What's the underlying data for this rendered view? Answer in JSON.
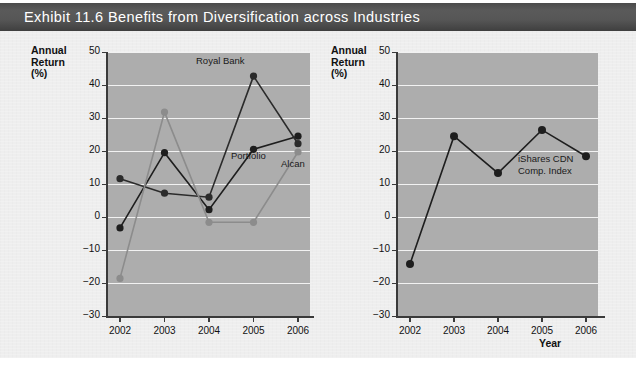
{
  "header": {
    "title": "Exhibit 11.6  Benefits from Diversification across Industries"
  },
  "colors": {
    "header_bar": "#4f4f4f",
    "panel": "#eeeeee",
    "plot_background": "#adadad",
    "gridline": "#f2f2f2",
    "axis": "#3a3a3a",
    "series_dark": "#1e1e1e",
    "series_mid": "#4a4a4a",
    "series_gray": "#8c8c8c"
  },
  "left_chart": {
    "y_axis_title_line1": "Annual",
    "y_axis_title_line2": "Return",
    "y_axis_title_line3": "(%)",
    "labels": {
      "royal_bank": "Royal Bank",
      "portfolio": "Portfolio",
      "alcan": "Alcan"
    }
  },
  "right_chart": {
    "y_axis_title_line1": "Annual",
    "y_axis_title_line2": "Return",
    "y_axis_title_line3": "(%)",
    "x_axis_title": "Year",
    "labels": {
      "ishares_line1": "iShares CDN",
      "ishares_line2": "Comp. Index"
    }
  },
  "chart_data": [
    {
      "id": "left",
      "type": "line",
      "title": "",
      "xlabel": "",
      "ylabel": "Annual Return (%)",
      "x": [
        "2002",
        "2003",
        "2004",
        "2005",
        "2006"
      ],
      "categories": [
        "2002",
        "2003",
        "2004",
        "2005",
        "2006"
      ],
      "ylim": [
        -30,
        50
      ],
      "yticks": [
        -30,
        -20,
        -10,
        0,
        10,
        20,
        30,
        40,
        50
      ],
      "ytick_labels": [
        "−30",
        "−20",
        "−10",
        "0",
        "10",
        "20",
        "30",
        "40",
        "50"
      ],
      "grid": true,
      "legend": "inline-annotations",
      "series": [
        {
          "name": "Royal Bank",
          "color": "#1e1e1e",
          "marker": "circle",
          "values": [
            -3.3,
            19.5,
            2.2,
            20.5,
            24.5
          ]
        },
        {
          "name": "Portfolio",
          "color": "#2b2b2b",
          "marker": "circle",
          "values": [
            11.6,
            7.2,
            6.0,
            42.7,
            22.2
          ]
        },
        {
          "name": "Alcan",
          "color": "#8c8c8c",
          "marker": "circle",
          "values": [
            -18.6,
            31.8,
            -1.6,
            -1.6,
            19.7
          ]
        }
      ]
    },
    {
      "id": "right",
      "type": "line",
      "title": "",
      "xlabel": "Year",
      "ylabel": "Annual Return (%)",
      "x": [
        "2002",
        "2003",
        "2004",
        "2005",
        "2006"
      ],
      "categories": [
        "2002",
        "2003",
        "2004",
        "2005",
        "2006"
      ],
      "ylim": [
        -30,
        50
      ],
      "yticks": [
        -30,
        -20,
        -10,
        0,
        10,
        20,
        30,
        40,
        50
      ],
      "ytick_labels": [
        "−30",
        "−20",
        "−10",
        "0",
        "10",
        "20",
        "30",
        "40",
        "50"
      ],
      "grid": true,
      "legend": "inline-annotations",
      "series": [
        {
          "name": "iShares CDN Comp. Index",
          "color": "#1e1e1e",
          "marker": "circle",
          "values": [
            -14.2,
            24.5,
            13.3,
            26.4,
            18.4
          ]
        }
      ]
    }
  ]
}
